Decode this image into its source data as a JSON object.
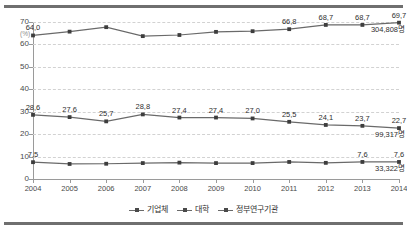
{
  "chart_data": {
    "type": "line",
    "title": "",
    "xlabel": "",
    "ylabel": "(%)",
    "ylim": [
      0,
      70
    ],
    "ytick_values": [
      0,
      10,
      20,
      30,
      40,
      50,
      60,
      70
    ],
    "ytick_labels": [
      "0",
      "10",
      "20",
      "30",
      "40",
      "50",
      "60",
      "70"
    ],
    "grid": true,
    "legend_position": "bottom-center",
    "categories": [
      "2004",
      "2005",
      "2006",
      "2007",
      "2008",
      "2009",
      "2010",
      "2011",
      "2012",
      "2013",
      "2014"
    ],
    "series": [
      {
        "name": "기업체",
        "values": [
          64.0,
          65.7,
          67.7,
          63.7,
          64.2,
          65.6,
          65.9,
          66.8,
          68.7,
          68.7,
          69.7
        ],
        "point_labels": [
          "64,0",
          "",
          "",
          "",
          "",
          "",
          "",
          "66,8",
          "68,7",
          "68,7",
          "69,7"
        ],
        "end_label": "304,808명"
      },
      {
        "name": "대학",
        "values": [
          28.6,
          27.6,
          25.7,
          28.8,
          27.4,
          27.4,
          27.0,
          25.5,
          24.1,
          23.7,
          22.7
        ],
        "point_labels": [
          "28,6",
          "27,6",
          "25,7",
          "28,8",
          "27,4",
          "27,4",
          "27,0",
          "25,5",
          "24,1",
          "23,7",
          "22,7"
        ],
        "end_label": "99,317명"
      },
      {
        "name": "정부연구기관",
        "values": [
          7.5,
          6.7,
          6.8,
          7.1,
          7.3,
          7.1,
          7.1,
          7.6,
          7.2,
          7.6,
          7.6
        ],
        "point_labels": [
          "7,5",
          "",
          "",
          "",
          "",
          "",
          "",
          "",
          "",
          "7,6",
          "7,6"
        ],
        "end_label": "33,322명"
      }
    ],
    "colors": {
      "line": "#6a6a6a",
      "marker": "#3d3d3d",
      "grid": "#d2d2d2",
      "axis": "#9a9a9a",
      "rule": "#6f6f6f",
      "text": "#2f2f2f"
    }
  }
}
